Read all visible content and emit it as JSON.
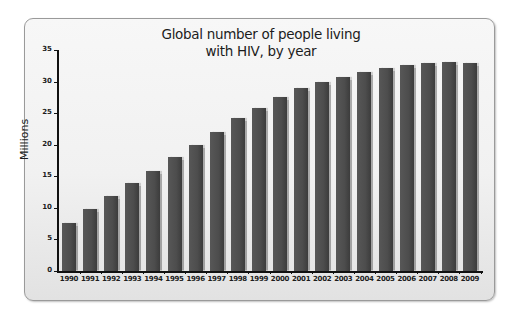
{
  "chart_data": {
    "type": "bar",
    "title": "Global number of people living with HIV, by year",
    "title_lines": [
      "Global number of people living",
      "with HIV, by year"
    ],
    "xlabel": "",
    "ylabel": "Millions",
    "ylim": [
      0,
      35
    ],
    "yticks": [
      0,
      5,
      10,
      15,
      20,
      25,
      30,
      35
    ],
    "grid": false,
    "legend": null,
    "categories": [
      "1990",
      "1991",
      "1992",
      "1993",
      "1994",
      "1995",
      "1996",
      "1997",
      "1998",
      "1999",
      "2000",
      "2001",
      "2002",
      "2003",
      "2004",
      "2005",
      "2006",
      "2007",
      "2008",
      "2009"
    ],
    "values": [
      7.6,
      9.8,
      11.8,
      13.9,
      15.8,
      18.0,
      20.0,
      22.0,
      24.2,
      25.8,
      27.6,
      29.0,
      29.9,
      30.7,
      31.5,
      32.1,
      32.6,
      33.0,
      33.1,
      33.0
    ],
    "bar_color": "#4d4d4d"
  }
}
